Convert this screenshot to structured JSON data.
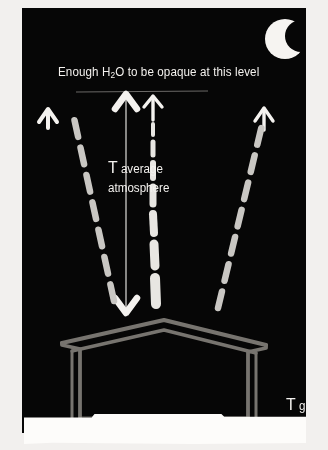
{
  "figure": {
    "kind": "atmosphere-greenhouse-diagram",
    "background_color": "#060606",
    "frame_color": "#f2f0ee",
    "ink_white": "#f4f2ef",
    "ink_gray": "#c9c7c3",
    "structure_gray": "#6e6c69"
  },
  "labels": {
    "opaque_level": {
      "text_before": "Enough H",
      "subscript": "2",
      "text_after": "O to be opaque at this level",
      "full_text": "Enough H2O to be opaque at this level"
    },
    "t_average_atmosphere": {
      "symbol": "T",
      "sub_line1": "average",
      "sub_line2": "atmosphere",
      "full_text": "T average atmosphere"
    },
    "t_ground": {
      "symbol": "T",
      "sub": "ground",
      "full_text": "T ground"
    }
  },
  "icons": {
    "moon": "crescent-moon-icon",
    "barn": "barn-house-icon"
  },
  "arrows": [
    {
      "name": "left-dashed-radiation-arrow",
      "style": "dashed",
      "direction": "up-left",
      "color": "#c9c7c3"
    },
    {
      "name": "center-dashed-radiation-arrow",
      "style": "dashed-tapered",
      "direction": "up",
      "color": "#e8e6e2"
    },
    {
      "name": "right-dashed-radiation-arrow",
      "style": "dashed",
      "direction": "up-right",
      "color": "#c9c7c3"
    },
    {
      "name": "left-solid-emission-arrow",
      "style": "solid-head",
      "direction": "up",
      "color": "#f4f2ef"
    },
    {
      "name": "center-solid-emission-arrow",
      "style": "solid-head",
      "direction": "up",
      "color": "#f4f2ef"
    },
    {
      "name": "right-solid-emission-arrow",
      "style": "solid-head",
      "direction": "up",
      "color": "#f4f2ef"
    },
    {
      "name": "atmosphere-depth-double-arrow",
      "style": "thin-double-headed",
      "direction": "vertical",
      "color": "#f4f2ef"
    }
  ],
  "guides": [
    {
      "name": "opaque-level-line",
      "orientation": "horizontal",
      "color": "#6e6c69"
    }
  ]
}
